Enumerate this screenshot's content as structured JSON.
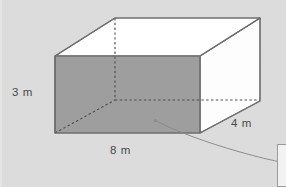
{
  "figure": {
    "kind": "rectangular-prism-diagram",
    "shape_name": "rectangular prism",
    "background_color": "#dcdcdc",
    "front_face_color": "#9e9e9e",
    "top_face_color": "#ffffff",
    "right_face_color": "#fdfdfd",
    "edge_color": "#6e6e6e",
    "hidden_edge_color": "#555555",
    "label_color": "#4a4a4a",
    "callout_line_color": "#8c8c8c"
  },
  "labels": {
    "height": "3 m",
    "width": "8 m",
    "depth": "4 m"
  },
  "dimensions": {
    "height_value": 3,
    "width_value": 8,
    "depth_value": 4,
    "unit": "m"
  },
  "callout": {
    "marker_name": "callout-anchor-dot",
    "target_name": "callout-box"
  },
  "geometry": {
    "front_top_left": [
      55,
      56
    ],
    "front_top_right": [
      200,
      56
    ],
    "front_bottom_right": [
      200,
      133
    ],
    "front_bottom_left": [
      55,
      133
    ],
    "back_top_left": [
      115,
      18
    ],
    "back_top_right": [
      260,
      18
    ],
    "back_bottom_right": [
      260,
      101
    ],
    "back_bottom_left": [
      115,
      100
    ]
  }
}
